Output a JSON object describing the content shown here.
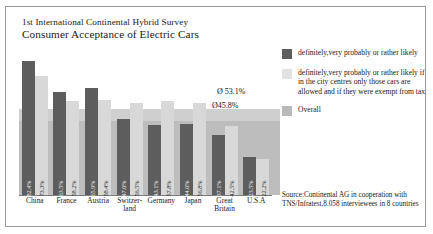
{
  "title": {
    "line1": "1st International Continental Hybrid Survey",
    "line2": "Consumer Acceptance of Electric Cars"
  },
  "legend": {
    "items": [
      {
        "swatch": "dark",
        "label": "definitely,very probably or rather likely"
      },
      {
        "swatch": "light",
        "label": "definitely,very probably or rather likely if in the city centres only those cars are allowed and if they were exempt from tax"
      },
      {
        "swatch": "medium",
        "label": "Overall"
      }
    ]
  },
  "annotations": {
    "avg_light": "Ø 53.1%",
    "avg_dark": "Ø45.8%"
  },
  "source": "Source:Continental AG in cooperation with TNS/Infratest,8.058 interviewees in 8 countries",
  "colors": {
    "dark_bar": "#5d5d5d",
    "light_bar": "#d8d8d8",
    "band_light": "#cfcfcf",
    "band_dark": "#bdbdbd",
    "frame": "#9a9a9a"
  },
  "chart_data": {
    "type": "bar",
    "title": "Consumer Acceptance of Electric Cars",
    "subtitle": "1st International Continental Hybrid Survey",
    "xlabel": "",
    "ylabel": "",
    "ylim": [
      0,
      90
    ],
    "grid": false,
    "legend_position": "right",
    "categories": [
      "China",
      "France",
      "Austria",
      "Switzer-land",
      "Germany",
      "Japan",
      "Great Britain",
      "U.S.A"
    ],
    "series": [
      {
        "name": "definitely,very probably or rather likely",
        "color": "#5d5d5d",
        "values": [
          82.4,
          63.5,
          65.9,
          47.0,
          43.1,
          44.0,
          37.1,
          23.5
        ],
        "labels": [
          "82.4%",
          "63.5%",
          "65.9%",
          "47.0%",
          "43.1%",
          "44.0%",
          "37.1%",
          "23.5%"
        ]
      },
      {
        "name": "definitely,very probably or rather likely if in the city centres only those cars are allowed and if they were exempt from tax",
        "color": "#d8d8d8",
        "values": [
          73.3,
          58.2,
          58.4,
          56.5,
          57.8,
          56.8,
          42.5,
          22.2
        ],
        "labels": [
          "73.3%",
          "58.2%",
          "58.4%",
          "56.5%",
          "57.8%",
          "56.8%",
          "42.5%",
          "22.2%"
        ]
      }
    ],
    "reference_bands": [
      {
        "name": "Ø 53.1%",
        "value": 53.1,
        "color": "#cfcfcf"
      },
      {
        "name": "Ø45.8%",
        "value": 45.8,
        "color": "#bdbdbd"
      }
    ]
  }
}
